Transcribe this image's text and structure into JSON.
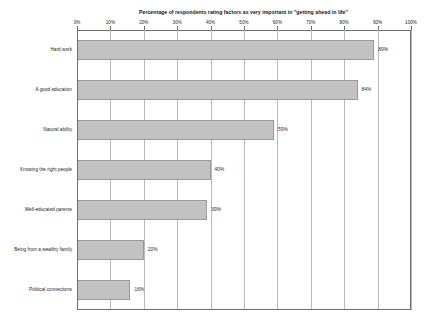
{
  "chart_data": {
    "type": "bar",
    "orientation": "horizontal",
    "title": "Percentage of respondents rating factors as very important in \"getting ahead in life\"",
    "xlabel": "",
    "ylabel": "",
    "xlim": [
      0,
      100
    ],
    "grid": true,
    "legend": "none",
    "categories": [
      "Hard work",
      "A good education",
      "Natural ability",
      "Knowing the right people",
      "Well-educated parents",
      "Being from a wealthy family",
      "Political connections"
    ],
    "values": [
      89,
      84,
      59,
      40,
      39,
      20,
      16
    ],
    "value_labels": [
      "89%",
      "84%",
      "59%",
      "40%",
      "39%",
      "20%",
      "16%"
    ],
    "xticks": [
      0,
      10,
      20,
      30,
      40,
      50,
      60,
      70,
      80,
      90,
      100
    ],
    "xtick_labels": [
      "0%",
      "10%",
      "20%",
      "30%",
      "40%",
      "50%",
      "60%",
      "70%",
      "80%",
      "90%",
      "100%"
    ],
    "bar_color": "#c2c2c2",
    "bar_border_color": "#9a9a9a",
    "axis_color": "#6e6e6e",
    "grid_color": "#b9b9b9",
    "text_color": "#1c1c1c",
    "background": "#ffffff"
  }
}
